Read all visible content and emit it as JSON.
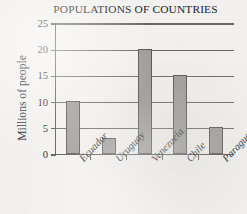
{
  "chart_data": {
    "type": "bar",
    "title": "POPULATIONS OF COUNTRIES",
    "xlabel": "",
    "ylabel": "Millions of people",
    "categories": [
      "Ecuador",
      "Uruguay",
      "Venezuela",
      "Chile",
      "Paraguay"
    ],
    "values": [
      10,
      3,
      20,
      15,
      5
    ],
    "ylim": [
      0,
      25
    ],
    "yticks": [
      0,
      5,
      10,
      15,
      20,
      25
    ],
    "ytick_labels": [
      "0",
      "5",
      "10",
      "15",
      "20",
      "25"
    ],
    "grid": "horizontal",
    "legend": "none",
    "bar_fill_color": "#9b9a98",
    "bar_edge_color": "#56514e",
    "axis_color": "#55504d",
    "background_color": "#f1f0ee",
    "text_color": "#23201f"
  }
}
